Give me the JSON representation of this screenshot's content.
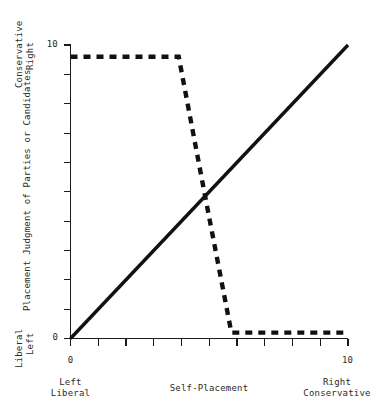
{
  "chart_data": {
    "type": "line",
    "title": "",
    "xlabel": "Self-Placement",
    "ylabel": "Placement Judgment of Parties or Candidates",
    "xlim": [
      0,
      10
    ],
    "ylim": [
      0,
      10
    ],
    "grid": false,
    "legend_position": "none",
    "x_axis": {
      "tick_values": [
        0,
        1,
        2,
        3,
        4,
        5,
        6,
        7,
        8,
        9,
        10
      ],
      "tick_labels_shown": [
        "0",
        "",
        "",
        "",
        "",
        "",
        "",
        "",
        "",
        "",
        "10"
      ],
      "min_label": "0",
      "max_label": "10",
      "pole_low_line1": "Left",
      "pole_low_line2": "Liberal",
      "pole_high_line1": "Right",
      "pole_high_line2": "Conservative"
    },
    "y_axis": {
      "tick_values": [
        0,
        1,
        2,
        3,
        4,
        5,
        6,
        7,
        8,
        9,
        10
      ],
      "tick_labels_shown": [
        "0",
        "",
        "",
        "",
        "",
        "",
        "",
        "",
        "",
        "",
        "10"
      ],
      "min_label": "0",
      "max_label": "10",
      "pole_low_line1": "Liberal",
      "pole_low_line2": "Left",
      "pole_high_line1": "Conservative",
      "pole_high_line2": "Right"
    },
    "series": [
      {
        "name": "identity-diagonal",
        "style": "solid",
        "x": [
          0,
          10
        ],
        "values": [
          0,
          10
        ]
      },
      {
        "name": "contrast-step",
        "style": "dashed",
        "x": [
          0,
          3.9,
          4.85,
          5.8,
          10
        ],
        "values": [
          9.6,
          9.6,
          4.85,
          0.2,
          0.2
        ]
      }
    ],
    "annotations": [
      {
        "name": "crossover-point",
        "x": 4.85,
        "y": 4.85
      }
    ]
  },
  "colors": {
    "ink": "#111111",
    "axis": "#1a1a1a",
    "text": "#2b2b2b",
    "background": "#ffffff"
  }
}
